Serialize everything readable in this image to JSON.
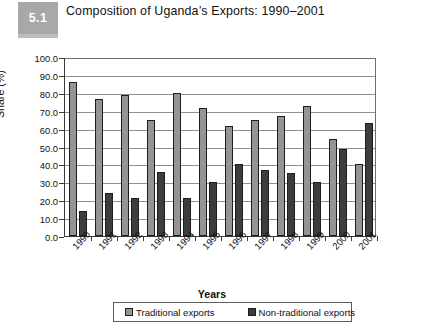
{
  "figure": {
    "badge_label": "5.1",
    "title": "Composition of Uganda’s Exports: 1990–2001"
  },
  "colors": {
    "traditional": "#949494",
    "non_traditional": "#3d3d3d",
    "badge": "#a8a8a8",
    "axis": "#3a3a3a",
    "gridline": "#8f8f8f"
  },
  "legend": {
    "position": "bottom",
    "entries": [
      {
        "label": "Traditional exports",
        "color": "#949494"
      },
      {
        "label": "Non-traditional exports",
        "color": "#3d3d3d"
      }
    ]
  },
  "chart_data": {
    "type": "bar",
    "title": "Composition of Uganda’s Exports: 1990–2001",
    "xlabel": "Years",
    "ylabel": "Share (%)",
    "ylim": [
      0,
      100
    ],
    "ytick_step": 10,
    "ytick_labels": [
      "0.0",
      "10.0",
      "20.0",
      "30.0",
      "40.0",
      "50.0",
      "60.0",
      "70.0",
      "80.0",
      "90.0",
      "100.0"
    ],
    "grid": true,
    "legend_position": "bottom",
    "categories": [
      "1990",
      "1991",
      "1992",
      "1993",
      "1994",
      "1995",
      "1996",
      "1997",
      "1998",
      "1999",
      "2000",
      "2001"
    ],
    "series": [
      {
        "name": "Traditional exports",
        "color": "#949494",
        "values": [
          86.0,
          76.5,
          79.0,
          65.0,
          80.0,
          71.5,
          61.5,
          65.0,
          67.0,
          72.5,
          54.0,
          40.0
        ]
      },
      {
        "name": "Non-traditional exports",
        "color": "#3d3d3d",
        "values": [
          14.0,
          24.0,
          21.5,
          36.0,
          21.0,
          30.0,
          40.0,
          37.0,
          35.0,
          30.0,
          48.5,
          63.0
        ]
      }
    ]
  }
}
